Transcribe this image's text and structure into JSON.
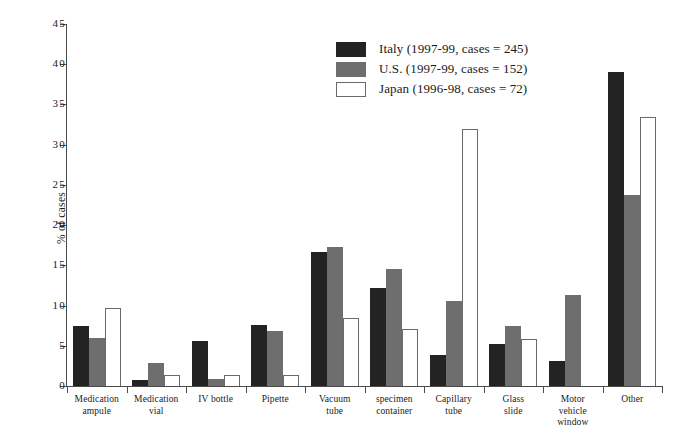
{
  "chart_data": {
    "type": "bar",
    "title": "",
    "xlabel": "",
    "ylabel": "% of cases",
    "ylim": [
      0,
      45
    ],
    "ytick_step": 5,
    "yticks": [
      "0",
      "5",
      "10",
      "15",
      "20",
      "25",
      "30",
      "35",
      "40",
      "45"
    ],
    "grid": false,
    "legend_position": "top-center",
    "categories": [
      "Medication ampule",
      "Medication vial",
      "IV bottle",
      "Pipette",
      "Vacuum tube",
      "specimen container",
      "Capillary tube",
      "Glass slide",
      "Motor vehicle window",
      "Other"
    ],
    "category_lines": [
      [
        "Medication",
        "ampule"
      ],
      [
        "Medication",
        "vial"
      ],
      [
        "IV bottle"
      ],
      [
        "Pipette"
      ],
      [
        "Vacuum",
        "tube"
      ],
      [
        "specimen",
        "container"
      ],
      [
        "Capillary",
        "tube"
      ],
      [
        "Glass",
        "slide"
      ],
      [
        "Motor",
        "vehicle",
        "window"
      ],
      [
        "Other"
      ]
    ],
    "series": [
      {
        "name": "Italy (1997-99, cases = 245)",
        "color": "#232323",
        "values": [
          7.4,
          0.8,
          5.6,
          7.6,
          16.7,
          12.2,
          3.9,
          5.2,
          3.1,
          39.0
        ]
      },
      {
        "name": "U.S. (1997-99, cases = 152)",
        "color": "#6e6e6e",
        "values": [
          6.0,
          2.8,
          0.9,
          6.9,
          17.3,
          14.5,
          10.6,
          7.4,
          11.3,
          23.8
        ]
      },
      {
        "name": "Japan (1996-98, cases = 72)",
        "color": "#ffffff",
        "values": [
          9.7,
          1.4,
          1.4,
          1.4,
          8.5,
          7.1,
          31.9,
          5.9,
          0.0,
          33.4
        ]
      }
    ]
  },
  "legend": {
    "items": [
      {
        "label": "Italy (1997-99, cases = 245)"
      },
      {
        "label": "U.S. (1997-99, cases = 152)"
      },
      {
        "label": "Japan (1996-98, cases = 72)"
      }
    ]
  }
}
